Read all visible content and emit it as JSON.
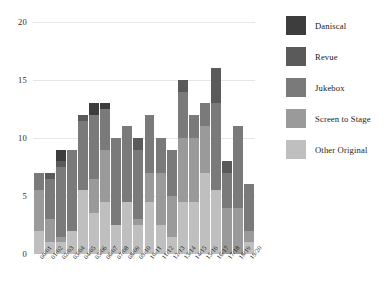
{
  "chart_data": {
    "type": "bar",
    "stacked": true,
    "title": "",
    "subtitle": "",
    "xlabel": "",
    "ylabel": "",
    "ylim": [
      0,
      20
    ],
    "yticks": [
      0,
      5,
      10,
      15,
      20
    ],
    "ytick_labels": [
      "0",
      "5",
      "10",
      "15",
      "20"
    ],
    "grid": true,
    "legend_position": "right",
    "categories": [
      "00/01",
      "01/02",
      "02/03",
      "03/04",
      "04/05",
      "05/06",
      "06/07",
      "07/08",
      "08/09",
      "09/10",
      "10/11",
      "11/12",
      "12/13",
      "13/14",
      "14/15",
      "15/16",
      "16/17",
      "17/18",
      "18/19",
      "19/20"
    ],
    "series": [
      {
        "name": "Other Original",
        "color": "#bfbfbf",
        "values": [
          2,
          1,
          1,
          2,
          5.5,
          3.5,
          4.5,
          2.5,
          4.5,
          2.5,
          4.5,
          2.5,
          1.5,
          4.5,
          4.5,
          7,
          5.5,
          0,
          0,
          1
        ]
      },
      {
        "name": "Screen to Stage",
        "color": "#9a9a9a",
        "values": [
          3.5,
          2,
          0.5,
          0,
          0,
          3,
          4.5,
          0,
          0,
          0.5,
          2.5,
          4.5,
          3.5,
          5.5,
          5.5,
          4,
          0,
          4,
          4,
          1
        ]
      },
      {
        "name": "Jukebox",
        "color": "#7a7a7a",
        "values": [
          1.5,
          3.5,
          6,
          7,
          6,
          5.5,
          3.5,
          7.5,
          6.5,
          6,
          5,
          3,
          4,
          4,
          2,
          2,
          7.5,
          3,
          7,
          4
        ]
      },
      {
        "name": "Revue",
        "color": "#5a5a5a",
        "values": [
          0,
          0.5,
          0.5,
          0,
          0.5,
          0,
          0,
          0,
          0,
          1,
          0,
          0,
          0,
          1,
          0,
          0,
          3,
          1,
          0,
          0
        ]
      },
      {
        "name": "Daniscal",
        "color": "#3d3d3d",
        "values": [
          0,
          0,
          1,
          0,
          0,
          1,
          0.5,
          0,
          0,
          0,
          0,
          0,
          0,
          0,
          0,
          0,
          0,
          0,
          0,
          0
        ]
      }
    ],
    "totals": [
      7,
      7,
      9,
      9,
      12,
      13,
      13,
      10,
      11,
      10,
      12,
      10,
      9,
      15,
      12,
      13,
      16,
      8,
      11,
      6
    ]
  },
  "legend": {
    "entries": [
      {
        "label": "Daniscal",
        "color": "#3d3d3d"
      },
      {
        "label": "Revue",
        "color": "#5a5a5a"
      },
      {
        "label": "Jukebox",
        "color": "#7a7a7a"
      },
      {
        "label": "Screen to Stage",
        "color": "#9a9a9a"
      },
      {
        "label": "Other Original",
        "color": "#bfbfbf"
      }
    ]
  }
}
